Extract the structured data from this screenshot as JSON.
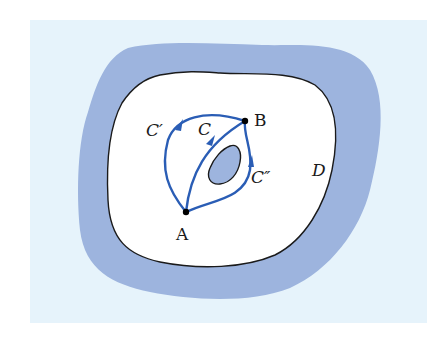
{
  "figure": {
    "colors": {
      "background_panel": "#e6f3fb",
      "region_fill": "#9db4de",
      "domain_fill": "#ffffff",
      "boundary_stroke": "#1a1a1a",
      "curve_stroke": "#2a5db5",
      "hole_fill": "#9db4de",
      "point_fill": "#000000"
    },
    "labels": {
      "point_a": "A",
      "point_b": "B",
      "curve_c": "C",
      "curve_c_prime": "C′",
      "curve_c_double_prime": "C″",
      "domain": "D"
    },
    "points": {
      "A": {
        "x": 186,
        "y": 212
      },
      "B": {
        "x": 245,
        "y": 121
      }
    }
  }
}
